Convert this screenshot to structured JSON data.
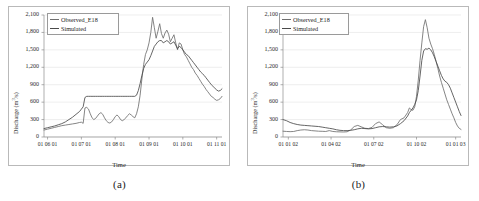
{
  "figure": {
    "background": "#ffffff",
    "panel_border_color": "#b9b9b9",
    "gridline_color": "#e2e2e2",
    "axis_color": "#8d8d8d"
  },
  "series_colors": {
    "observed": "#6f6f6f",
    "simulated": "#4a4a4a"
  },
  "panels": [
    {
      "caption": "(a)",
      "chart_data": {
        "type": "line",
        "title": "",
        "xlabel": "Time",
        "ylabel": "Discharge (m3/s)",
        "ylabel_display": "Discharge (m",
        "ylabel_sup": "3",
        "ylabel_tail": "/s)",
        "ylim": [
          0,
          2100
        ],
        "yticks": [
          0,
          300,
          600,
          900,
          1200,
          1500,
          1800,
          2100
        ],
        "ytick_labels": [
          "0",
          "300",
          "600",
          "900",
          "1,200",
          "1,500",
          "1,800",
          "2,100"
        ],
        "xlim": [
          0,
          100
        ],
        "xticks": [
          2,
          21,
          40,
          59,
          78,
          97
        ],
        "xtick_labels": [
          "01 06 01",
          "01 07 01",
          "01 08 01",
          "01 09 01",
          "01 10 01",
          "01 11 01"
        ],
        "grid": true,
        "legend_position": "top-left",
        "legend": [
          "Observed_E18",
          "Simulated"
        ],
        "x": [
          0,
          2,
          4,
          6,
          8,
          10,
          12,
          14,
          16,
          18,
          20,
          21,
          22,
          23,
          24,
          25,
          26,
          27,
          28,
          29,
          30,
          31,
          32,
          33,
          34,
          35,
          36,
          37,
          38,
          39,
          40,
          41,
          42,
          43,
          44,
          45,
          46,
          47,
          48,
          49,
          50,
          51,
          52,
          53,
          54,
          55,
          56,
          57,
          58,
          59,
          60,
          61,
          62,
          63,
          64,
          65,
          66,
          67,
          68,
          69,
          70,
          71,
          72,
          73,
          74,
          75,
          76,
          77,
          78,
          79,
          80,
          81,
          82,
          83,
          84,
          85,
          86,
          87,
          88,
          89,
          90,
          91,
          92,
          93,
          94,
          95,
          96,
          97,
          98,
          99,
          100
        ],
        "series": [
          {
            "name": "Observed_E18",
            "values": [
              120,
              135,
              150,
              165,
              180,
              195,
              205,
              215,
              225,
              235,
              250,
              255,
              235,
              500,
              510,
              480,
              400,
              330,
              300,
              320,
              360,
              400,
              420,
              390,
              330,
              280,
              250,
              240,
              260,
              300,
              350,
              380,
              350,
              300,
              280,
              300,
              330,
              370,
              400,
              380,
              350,
              330,
              400,
              520,
              720,
              1000,
              1250,
              1420,
              1500,
              1620,
              1800,
              2060,
              1880,
              1700,
              1820,
              1950,
              1780,
              1700,
              1790,
              1840,
              1770,
              1640,
              1700,
              1760,
              1620,
              1500,
              1620,
              1600,
              1500,
              1420,
              1380,
              1320,
              1260,
              1200,
              1160,
              1100,
              1060,
              1010,
              960,
              910,
              870,
              820,
              780,
              740,
              700,
              680,
              650,
              630,
              640,
              660,
              700
            ]
          },
          {
            "name": "Simulated",
            "values": [
              145,
              160,
              175,
              190,
              210,
              230,
              260,
              300,
              340,
              390,
              440,
              480,
              520,
              680,
              700,
              700,
              700,
              700,
              700,
              700,
              700,
              700,
              700,
              700,
              700,
              700,
              700,
              700,
              700,
              700,
              700,
              700,
              700,
              700,
              700,
              700,
              700,
              700,
              700,
              700,
              700,
              700,
              720,
              800,
              920,
              1060,
              1180,
              1250,
              1290,
              1330,
              1400,
              1480,
              1560,
              1600,
              1640,
              1660,
              1660,
              1620,
              1640,
              1660,
              1640,
              1600,
              1620,
              1640,
              1580,
              1520,
              1560,
              1540,
              1500,
              1460,
              1420,
              1400,
              1360,
              1320,
              1280,
              1240,
              1200,
              1160,
              1120,
              1090,
              1060,
              1020,
              980,
              940,
              900,
              870,
              840,
              810,
              790,
              800,
              830,
              890
            ]
          }
        ]
      }
    },
    {
      "caption": "(b)",
      "chart_data": {
        "type": "line",
        "title": "",
        "xlabel": "Time",
        "ylabel": "Discharge (m3/s)",
        "ylabel_display": "Discharge (m",
        "ylabel_sup": "3",
        "ylabel_tail": "/s)",
        "ylim": [
          0,
          2100
        ],
        "yticks": [
          0,
          300,
          600,
          900,
          1200,
          1500,
          1800,
          2100
        ],
        "ytick_labels": [
          "0",
          "300",
          "600",
          "900",
          "1,200",
          "1,500",
          "1,800",
          "2,100"
        ],
        "xlim": [
          0,
          100
        ],
        "xticks": [
          3,
          27,
          51,
          75,
          97
        ],
        "xtick_labels": [
          "01 01 02",
          "01 04 02",
          "01 07 02",
          "01 10 02",
          "01 01 03"
        ],
        "grid": true,
        "legend_position": "top-left",
        "legend": [
          "Observed_E18",
          "Simulated"
        ],
        "x": [
          0,
          2,
          4,
          6,
          8,
          10,
          12,
          14,
          16,
          18,
          20,
          22,
          24,
          26,
          28,
          30,
          32,
          34,
          36,
          38,
          40,
          42,
          44,
          46,
          48,
          50,
          52,
          54,
          56,
          58,
          60,
          62,
          64,
          66,
          68,
          70,
          71,
          72,
          73,
          74,
          75,
          76,
          77,
          78,
          79,
          80,
          81,
          82,
          83,
          84,
          85,
          86,
          87,
          88,
          89,
          90,
          91,
          92,
          93,
          94,
          95,
          96,
          97,
          98,
          99,
          100
        ],
        "series": [
          {
            "name": "Observed_E18",
            "values": [
              100,
              95,
              92,
              95,
              110,
              120,
              125,
              120,
              110,
              105,
              100,
              98,
              95,
              110,
              95,
              90,
              88,
              86,
              90,
              120,
              180,
              200,
              175,
              150,
              145,
              165,
              230,
              260,
              210,
              160,
              150,
              160,
              210,
              300,
              330,
              420,
              500,
              470,
              460,
              520,
              700,
              980,
              1320,
              1620,
              1900,
              2020,
              1880,
              1700,
              1600,
              1520,
              1420,
              1300,
              1180,
              1050,
              940,
              840,
              740,
              640,
              560,
              480,
              400,
              330,
              250,
              190,
              150,
              130
            ]
          },
          {
            "name": "Simulated",
            "values": [
              300,
              280,
              250,
              230,
              215,
              205,
              200,
              195,
              190,
              185,
              180,
              170,
              160,
              150,
              140,
              125,
              115,
              110,
              110,
              115,
              125,
              140,
              150,
              145,
              140,
              145,
              160,
              175,
              180,
              175,
              170,
              175,
              190,
              230,
              280,
              360,
              420,
              460,
              500,
              560,
              640,
              800,
              1050,
              1320,
              1480,
              1520,
              1510,
              1530,
              1500,
              1450,
              1380,
              1300,
              1220,
              1140,
              1060,
              1000,
              960,
              940,
              900,
              840,
              760,
              680,
              600,
              520,
              440,
              370
            ]
          }
        ]
      }
    }
  ]
}
